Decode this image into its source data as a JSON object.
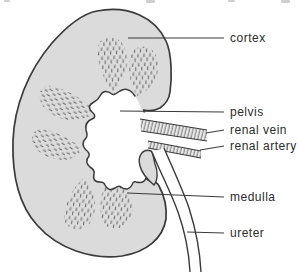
{
  "labels": [
    {
      "text": "cortex"
    },
    {
      "text": "pelvis"
    },
    {
      "text": "renal vein"
    },
    {
      "text": "renal artery"
    },
    {
      "text": "medulla"
    },
    {
      "text": "ureter"
    }
  ],
  "colors": {
    "background": "#ffffff",
    "kidney_fill": "#dbdbdb",
    "outline": "#3a3a3a",
    "hatch": "#4f4f4f",
    "stripe": "#6a6a6a",
    "band_fill": "#e9e9e9",
    "pelvis_fill": "#ffffff",
    "label_text": "#2b2b2b",
    "leader_line": "#3a3a3a"
  }
}
